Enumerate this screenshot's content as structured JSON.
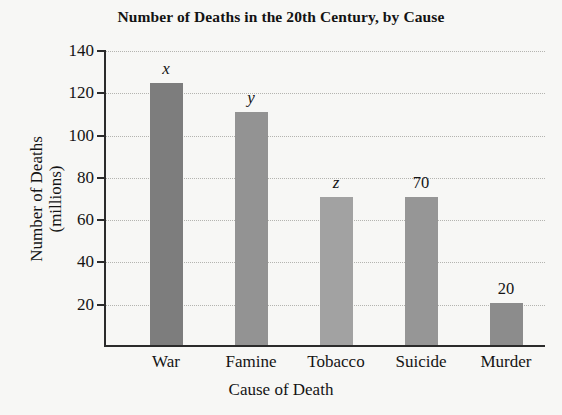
{
  "chart_data": {
    "type": "bar",
    "title": "Number of Deaths in the 20th Century, by Cause",
    "xlabel": "Cause of Death",
    "ylabel_line1": "Number of Deaths",
    "ylabel_line2": "(millions)",
    "ylabel": "Number of Deaths (millions)",
    "categories": [
      "War",
      "Famine",
      "Tobacco",
      "Suicide",
      "Murder"
    ],
    "values": [
      124,
      110,
      70,
      70,
      20
    ],
    "point_labels": [
      "x",
      "y",
      "z",
      "70",
      "20"
    ],
    "label_is_variable": [
      true,
      true,
      true,
      false,
      false
    ],
    "bar_colors": [
      "#7d7d7d",
      "#939393",
      "#a2a2a2",
      "#969696",
      "#8c8c8c"
    ],
    "ylim": [
      0,
      140
    ],
    "ytick_values": [
      20,
      40,
      60,
      80,
      100,
      120,
      140
    ],
    "ytick_labels": [
      "20",
      "40",
      "60",
      "80",
      "100",
      "120",
      "140"
    ],
    "grid": true,
    "grid_style": "dotted",
    "legend": "none",
    "axis_color": "#2b2b2b",
    "background": "#f7f7f5"
  }
}
